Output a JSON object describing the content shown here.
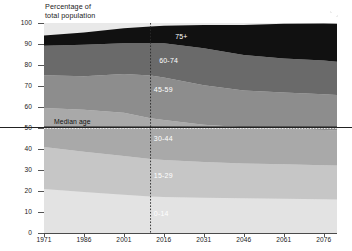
{
  "chart_data": {
    "type": "area",
    "title": "",
    "subtitle": "",
    "ylabel": "Percentage of\ntotal population",
    "xlabel": "",
    "ylim": [
      0,
      100
    ],
    "xlim": [
      1971,
      2081
    ],
    "grid": false,
    "legend_position": "inline-band-labels",
    "stacked": true,
    "x": [
      1971,
      1986,
      2001,
      2011,
      2016,
      2031,
      2046,
      2061,
      2076,
      2081
    ],
    "y_ticks": [
      "0",
      "10",
      "20",
      "30",
      "40",
      "50",
      "60",
      "70",
      "80",
      "90",
      "100"
    ],
    "x_ticks": [
      "1971",
      "1986",
      "2001",
      "2016",
      "2031",
      "2046",
      "2061",
      "2076"
    ],
    "series": [
      {
        "name": "0-14",
        "color": "#e3e3e3",
        "values": [
          21.0,
          19.5,
          18.2,
          17.4,
          17.2,
          16.8,
          16.5,
          16.3,
          16.1,
          16.0
        ]
      },
      {
        "name": "15-29",
        "color": "#c6c6c6",
        "values": [
          20.0,
          19.2,
          18.5,
          17.8,
          17.6,
          17.0,
          16.6,
          16.4,
          16.2,
          16.1
        ]
      },
      {
        "name": "30-44",
        "color": "#a9a9a9",
        "values": [
          18.5,
          20.0,
          20.6,
          19.4,
          19.0,
          17.8,
          17.2,
          17.0,
          16.8,
          16.7
        ]
      },
      {
        "name": "45-59",
        "color": "#8d8d8d",
        "values": [
          15.6,
          16.0,
          18.4,
          20.4,
          20.3,
          18.8,
          17.6,
          17.2,
          17.0,
          16.9
        ]
      },
      {
        "name": "60-74",
        "color": "#6a6a6a",
        "values": [
          14.1,
          15.0,
          14.6,
          15.3,
          16.2,
          17.6,
          16.9,
          16.2,
          16.0,
          15.9
        ]
      },
      {
        "name": "75+",
        "color": "#111111",
        "values": [
          4.8,
          5.8,
          7.2,
          8.0,
          8.4,
          11.0,
          14.2,
          16.5,
          17.7,
          18.0
        ]
      }
    ],
    "annotations": [
      {
        "name": "median-age-line",
        "label": "Median age",
        "type": "horizontal-line",
        "value": 50.5,
        "style": "solid"
      },
      {
        "name": "median-age-dotted-overlay",
        "label": "",
        "type": "horizontal-line",
        "value": 49.8,
        "style": "dotted"
      },
      {
        "name": "projection-start-line",
        "label": "",
        "type": "vertical-line",
        "value": 2011,
        "style": "dotted"
      }
    ],
    "band_labels": [
      {
        "name": "75+",
        "x": 2024,
        "y": 93.5,
        "contrast": "dark"
      },
      {
        "name": "60-74",
        "x": 2018,
        "y": 82.0,
        "contrast": "dark"
      },
      {
        "name": "45-59",
        "x": 2016,
        "y": 68.0,
        "contrast": "dark"
      },
      {
        "name": "30-44",
        "x": 2016,
        "y": 45.0,
        "contrast": "dark"
      },
      {
        "name": "15-29",
        "x": 2016,
        "y": 27.0,
        "contrast": "dark"
      },
      {
        "name": "0-14",
        "x": 2016,
        "y": 9.0,
        "contrast": "dark"
      }
    ]
  }
}
